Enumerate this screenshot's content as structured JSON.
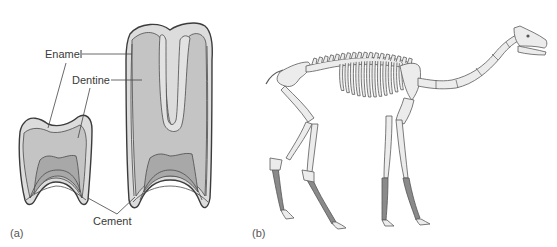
{
  "figure": {
    "panel_a": {
      "label": "(a)",
      "description": "Cross-sections of a low-crowned and a high-crowned tooth",
      "labels": {
        "enamel": "Enamel",
        "dentine": "Dentine",
        "cement": "Cement"
      }
    },
    "panel_b": {
      "label": "(b)",
      "description": "Skeleton of a long-legged, long-necked mammal"
    },
    "colors": {
      "enamel": "#dcdcdc",
      "dentine": "#c2c2c2",
      "pulp": "#a8a8a8",
      "bone": "#ececec",
      "lower_limb": "#8a8a8a",
      "outline": "#3c3c3c"
    }
  }
}
